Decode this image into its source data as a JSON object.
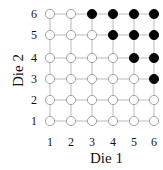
{
  "chart_data": {
    "type": "scatter",
    "title": "",
    "xlabel": "Die 1",
    "ylabel": "Die 2",
    "x_ticks": [
      "1",
      "2",
      "3",
      "4",
      "5",
      "6"
    ],
    "y_ticks": [
      "1",
      "2",
      "3",
      "4",
      "5",
      "6"
    ],
    "grid": true,
    "filled_points": [
      [
        3,
        6
      ],
      [
        4,
        6
      ],
      [
        5,
        6
      ],
      [
        6,
        6
      ],
      [
        4,
        5
      ],
      [
        5,
        5
      ],
      [
        6,
        5
      ],
      [
        5,
        4
      ],
      [
        6,
        4
      ],
      [
        6,
        3
      ]
    ],
    "open_points_count": 26,
    "filled_color": "#000000",
    "open_color": "#ffffff",
    "grid_color": "#bbbbbb"
  },
  "labels": {
    "x_axis": "Die 1",
    "y_axis": "Die 2"
  }
}
